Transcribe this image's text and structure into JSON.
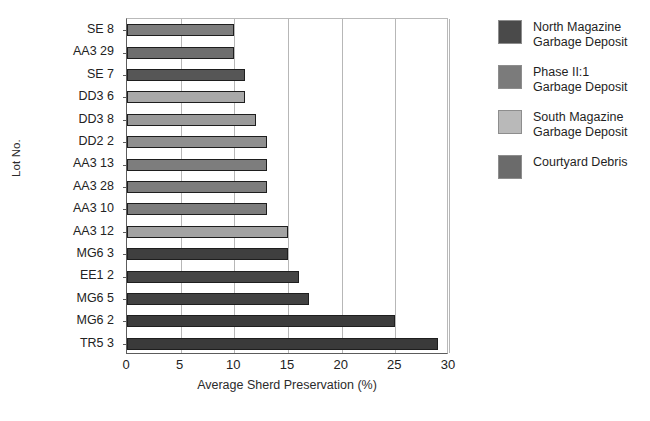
{
  "chart_data": {
    "type": "bar",
    "orientation": "horizontal",
    "title": "",
    "xlabel": "Average Sherd Preservation (%)",
    "ylabel": "Lot No.",
    "categories": [
      "SE 8",
      "AA3 29",
      "SE 7",
      "DD3 6",
      "DD3 8",
      "DD2 2",
      "AA3 13",
      "AA3 28",
      "AA3 10",
      "AA3 12",
      "MG6 3",
      "EE1 2",
      "MG6 5",
      "MG6 2",
      "TR5 3"
    ],
    "values": [
      10,
      10,
      11,
      11,
      12,
      13,
      13,
      13,
      13,
      15,
      15,
      16,
      17,
      25,
      29
    ],
    "bar_groups": [
      "Phase II:1 Garbage Deposit",
      "Phase II:1 Garbage Deposit",
      "Courtyard Debris",
      "South Magazine Garbage Deposit",
      "South Magazine Garbage Deposit",
      "South Magazine Garbage Deposit",
      "Phase II:1 Garbage Deposit",
      "Phase II:1 Garbage Deposit",
      "Phase II:1 Garbage Deposit",
      "South Magazine Garbage Deposit",
      "North Magazine Garbage Deposit",
      "North Magazine Garbage Deposit",
      "North Magazine Garbage Deposit",
      "North Magazine Garbage Deposit",
      "North Magazine Garbage Deposit"
    ],
    "bar_colors": [
      "#7d7d7d",
      "#6e6e6e",
      "#565656",
      "#a9a9a9",
      "#9a9a9a",
      "#8f8f8f",
      "#7d7d7d",
      "#7d7d7d",
      "#7d7d7d",
      "#a3a3a3",
      "#3f3f3f",
      "#454545",
      "#424242",
      "#3c3c3c",
      "#3a3a3a"
    ],
    "xlim": [
      0,
      30
    ],
    "xticks": [
      0,
      5,
      10,
      15,
      20,
      25,
      30
    ],
    "xticklabels": [
      "0",
      "5",
      "10",
      "15",
      "20",
      "25",
      "30"
    ],
    "grid": "vertical",
    "legend_position": "right"
  },
  "legend": {
    "items": [
      {
        "label": "North Magazine\nGarbage Deposit",
        "color": "#4a4a4a"
      },
      {
        "label": "Phase II:1\nGarbage Deposit",
        "color": "#7b7b7b"
      },
      {
        "label": "South Magazine\nGarbage Deposit",
        "color": "#b9b9b9"
      },
      {
        "label": "Courtyard Debris",
        "color": "#6b6b6b"
      }
    ]
  }
}
